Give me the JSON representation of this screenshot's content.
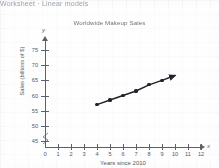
{
  "page": {
    "top_strip_text": "Worksheet · Linear models"
  },
  "chart_data": {
    "type": "line",
    "title": "Worldwide Makeup Sales",
    "xlabel": "Years since 2010",
    "ylabel": "Sales (billions of $)",
    "x_axis_letter": "x",
    "y_axis_letter": "y",
    "origin_label": "0",
    "xlim": [
      0,
      12
    ],
    "ylim": [
      43,
      77
    ],
    "y_axis_break": true,
    "grid": true,
    "legend": "none",
    "xticks": [
      1,
      2,
      3,
      4,
      5,
      6,
      7,
      8,
      9,
      10,
      11,
      12
    ],
    "yticks": [
      45,
      50,
      55,
      60,
      65,
      70,
      75
    ],
    "x": [
      4,
      5,
      6,
      7,
      8,
      9
    ],
    "values": [
      57,
      58.5,
      60,
      61.5,
      63.5,
      65
    ],
    "line_extends_to_x": 10,
    "line_has_arrowhead": true,
    "marker_color": "#20232a",
    "line_color": "#20232a",
    "axis_color": "#5d6068"
  }
}
